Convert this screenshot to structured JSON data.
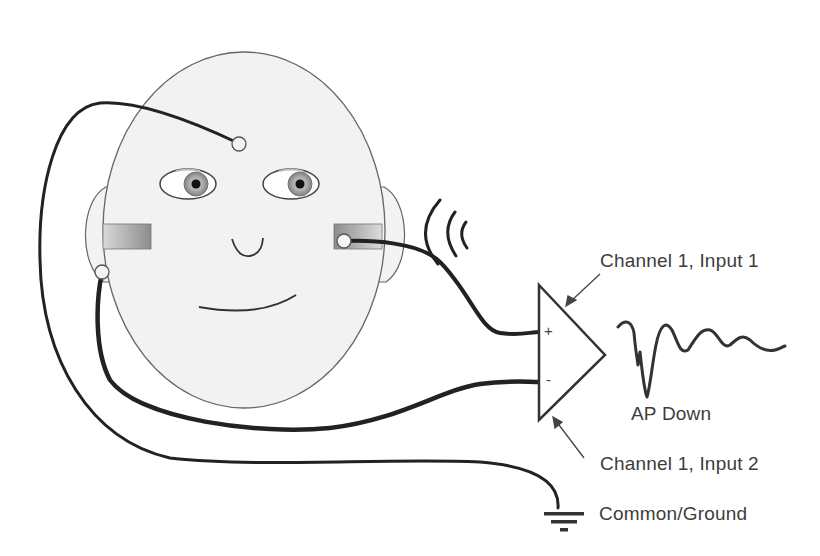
{
  "diagram": {
    "type": "electrode-montage-schematic",
    "labels": {
      "channel1_input1": "Channel 1, Input 1",
      "channel1_input2": "Channel 1, Input 2",
      "common_ground": "Common/Ground",
      "waveform": "AP Down"
    },
    "amplifier": {
      "plus_sign": "+",
      "minus_sign": "-"
    },
    "electrodes": [
      {
        "id": "forehead",
        "connects_to": "common_ground"
      },
      {
        "id": "ear-canal-tiptrode",
        "connects_to": "channel1_input1"
      },
      {
        "id": "earlobe",
        "connects_to": "channel1_input2"
      }
    ],
    "stimulus": "sound-waves",
    "colors": {
      "face_fill": "#f2f2f2",
      "outline": "#555555",
      "wire": "#222222",
      "text": "#3d3d3d"
    }
  }
}
